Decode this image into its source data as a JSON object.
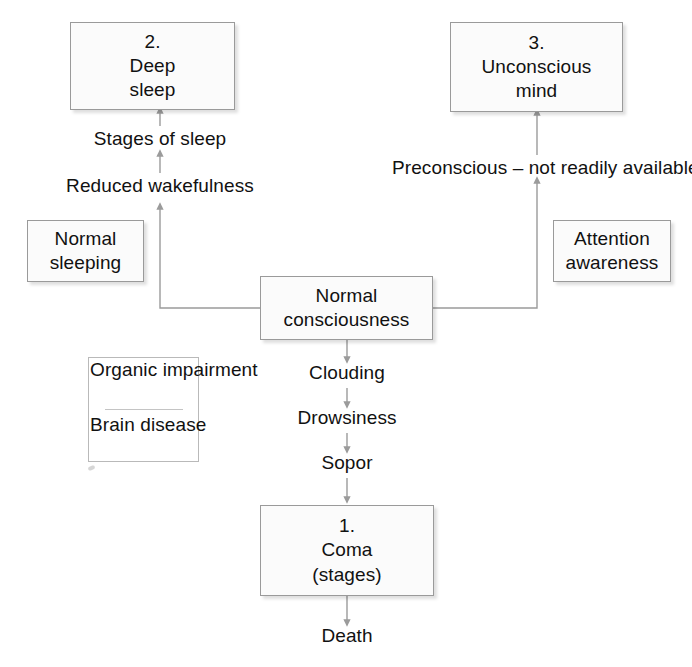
{
  "diagram": {
    "background_color": "#ffffff",
    "box_fill_color": "#fbfbfb",
    "box_border_color": "#9a9a9a",
    "connector_color": "#9b9b9b",
    "text_color": "#111111"
  },
  "nodes": [
    {
      "id": "deep-sleep",
      "lines": [
        "2.",
        "Deep",
        "sleep"
      ],
      "number": "2."
    },
    {
      "id": "unconscious-mind",
      "lines": [
        "3.",
        "Unconscious",
        "mind"
      ],
      "number": "3."
    },
    {
      "id": "normal-sleeping",
      "lines": [
        "Normal",
        "sleeping"
      ],
      "number": ""
    },
    {
      "id": "attention-awareness",
      "lines": [
        "Attention",
        "awareness"
      ],
      "number": ""
    },
    {
      "id": "normal-consciousness",
      "lines": [
        "Normal",
        "consciousness"
      ],
      "number": ""
    },
    {
      "id": "coma",
      "lines": [
        "1.",
        "Coma",
        "(stages)"
      ],
      "number": "1."
    }
  ],
  "bracket_group": {
    "id": "organic-impairment",
    "top_lines": [
      "Organic",
      "impairment"
    ],
    "bottom_lines": [
      "Brain",
      "disease"
    ]
  },
  "edge_labels": [
    {
      "id": "stages-of-sleep",
      "text": "Stages of sleep"
    },
    {
      "id": "reduced-wakefulness",
      "text": "Reduced wakefulness"
    },
    {
      "id": "preconscious",
      "text": "Preconscious – not readily available"
    },
    {
      "id": "clouding",
      "text": "Clouding"
    },
    {
      "id": "drowsiness",
      "text": "Drowsiness"
    },
    {
      "id": "sopor",
      "text": "Sopor"
    },
    {
      "id": "death",
      "text": "Death"
    }
  ]
}
